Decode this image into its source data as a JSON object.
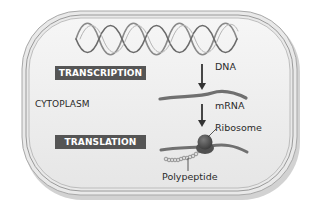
{
  "diagram": {
    "type": "biology-central-dogma-prokaryote",
    "region_label": "CYTOPLASM",
    "process_labels": {
      "transcription": "TRANSCRIPTION",
      "translation": "TRANSLATION"
    },
    "molecule_labels": {
      "dna": "DNA",
      "mrna": "mRNA",
      "ribosome": "Ribosome",
      "polypeptide": "Polypeptide"
    },
    "flow": [
      "DNA",
      "mRNA",
      "Polypeptide"
    ],
    "colors": {
      "cell_fill": "#efefef",
      "membrane": "#9a9a9a",
      "label_box": "#555555",
      "label_text": "#ffffff",
      "dna": "#7a7a7a",
      "mrna": "#6e6e6e",
      "ribosome": "#4a4a4a",
      "arrow": "#333333"
    }
  }
}
